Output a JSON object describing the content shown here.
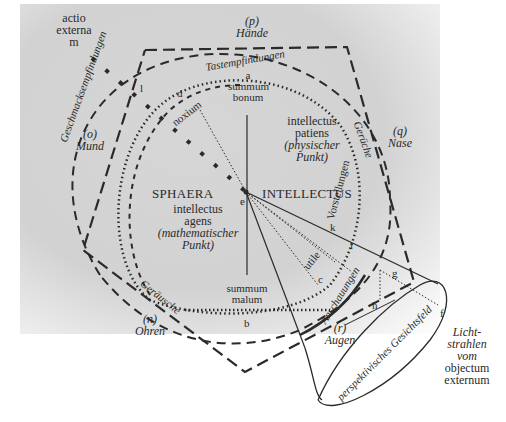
{
  "diagram": {
    "title_left": "SPHAERA",
    "title_right": "INTELLECTUS",
    "center_point": "e",
    "top_pole": {
      "letter": "a",
      "line1": "summum",
      "line2": "bonum"
    },
    "bottom_pole": {
      "line1": "summum",
      "line2": "malum",
      "letter": "b"
    },
    "noxium": {
      "letter": "d",
      "label": "noxium"
    },
    "utile": {
      "label": "utile",
      "letter": "c"
    },
    "actio_externa": {
      "line1": "actio",
      "line2": "externa",
      "letter": "m"
    },
    "point_l": "l",
    "intellectus_patiens": {
      "line1": "intellectus",
      "line2": "patiens",
      "line3": "(physischer",
      "line4": "Punkt)"
    },
    "intellectus_agens": {
      "line1": "intellectus",
      "line2": "agens",
      "line3": "(mathematischer",
      "line4": "Punkt)"
    },
    "senses": {
      "haende": {
        "tag": "(p)",
        "name": "Hände",
        "sensation": "Tastempfindungen"
      },
      "mund": {
        "tag": "(o)",
        "name": "Mund",
        "sensation": "Geschmacksempfindungen"
      },
      "nase": {
        "tag": "(q)",
        "name": "Nase",
        "sensation": "Gerüche"
      },
      "ohren": {
        "tag": "(n)",
        "name": "Ohren",
        "sensation": "Geräusche"
      },
      "augen": {
        "tag": "(r)",
        "name": "Augen",
        "sensation": "Anschauungen"
      }
    },
    "vorstellungen": "Vorstellungen",
    "cone": {
      "field_label": "perspektivisches Gesichtsfeld",
      "points": {
        "g": "g",
        "h": "h",
        "i": "i",
        "k": "k",
        "f": "f"
      },
      "light": {
        "line1": "Licht-",
        "line2": "strahlen",
        "line3": "vom",
        "line4": "objectum",
        "line5": "externum"
      }
    },
    "colors": {
      "ink": "#2a2a2a",
      "paper": "#d4d4d4",
      "background": "#ffffff"
    }
  }
}
